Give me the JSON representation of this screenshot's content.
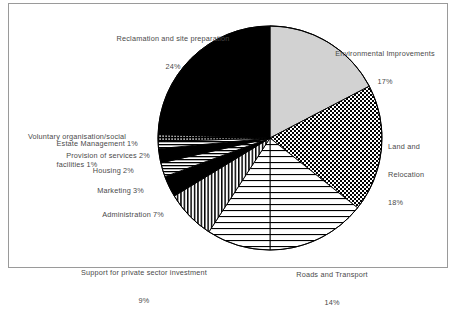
{
  "chart_data": {
    "type": "pie",
    "title": "",
    "categories": [
      "Environmental Improvements",
      "Land and Relocation",
      "Roads and Transport",
      "Support for private sector investment",
      "Administration",
      "Marketing",
      "Housing",
      "Provision of services",
      "Estate Management",
      "Voluntary organisation/social facilities",
      "Reclamation and site preparation"
    ],
    "values": [
      17,
      18,
      14,
      9,
      7,
      3,
      2,
      2,
      1,
      1,
      24
    ],
    "value_unit": "%",
    "legend": "labels-outside",
    "grid": false,
    "slices": [
      {
        "label": "Environmental Improvements",
        "value": 17,
        "value_text": "17%",
        "pattern": "solid-light-gray",
        "color": "#d2d2d2"
      },
      {
        "label": "Land and Relocation",
        "value": 18,
        "value_text": "18%",
        "pattern": "checkerboard",
        "color": "#000000"
      },
      {
        "label": "Roads and Transport",
        "value": 14,
        "value_text": "14%",
        "pattern": "horizontal-lines",
        "color": "#000000"
      },
      {
        "label": "Support for private sector investment",
        "value": 9,
        "value_text": "9%",
        "pattern": "horizontal-lines",
        "color": "#000000"
      },
      {
        "label": "Administration",
        "value": 7,
        "value_text": "7%",
        "pattern": "vertical-lines",
        "color": "#000000"
      },
      {
        "label": "Marketing",
        "value": 3,
        "value_text": "3%",
        "pattern": "solid-black",
        "color": "#000000"
      },
      {
        "label": "Housing",
        "value": 2,
        "value_text": "2%",
        "pattern": "horizontal-lines-fine",
        "color": "#000000"
      },
      {
        "label": "Provision of services",
        "value": 2,
        "value_text": "2%",
        "pattern": "solid-black",
        "color": "#000000"
      },
      {
        "label": "Estate Management",
        "value": 1,
        "value_text": "1%",
        "pattern": "horizontal-lines-fine",
        "color": "#000000"
      },
      {
        "label": "Voluntary organisation/social facilities",
        "value": 1,
        "value_text": "1%",
        "pattern": "dotted-grid",
        "color": "#000000"
      },
      {
        "label": "Reclamation and site preparation",
        "value": 24,
        "value_text": "24%",
        "pattern": "solid-black",
        "color": "#000000"
      }
    ]
  },
  "labels": {
    "reclamation_line1": "Reclamation and site preparation",
    "reclamation_line2": "24%",
    "environmental_line1": "Environmental Improvements",
    "environmental_line2": "17%",
    "land_line1": "Land and",
    "land_line2": "Relocation",
    "land_line3": "18%",
    "roads_line1": "Roads and Transport",
    "roads_line2": "14%",
    "support_line1": "Support for private sector investment",
    "support_line2": "9%",
    "administration": "Administration 7%",
    "marketing": "Marketing 3%",
    "housing": "Housing 2%",
    "provision": "Provision of services 2%",
    "estate": "Estate Management 1%",
    "voluntary_line1": "Voluntary organisation/social",
    "voluntary_line2": "facilities 1%"
  }
}
